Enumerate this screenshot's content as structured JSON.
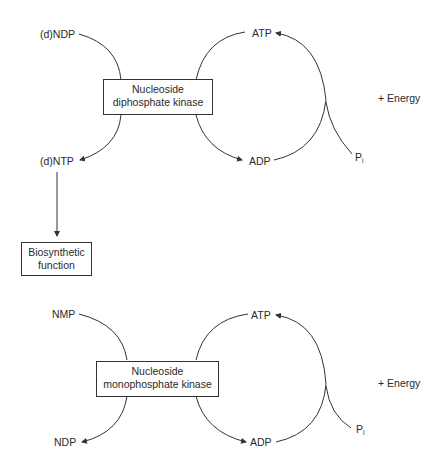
{
  "diagram_top": {
    "substrate": "(d)NDP",
    "product": "(d)NTP",
    "enzyme_line1": "Nucleoside",
    "enzyme_line2": "diphosphate kinase",
    "donor": "ATP",
    "donor_product": "ADP",
    "phosphate": "P",
    "phosphate_sub": "i",
    "energy": "+ Energy",
    "output_line1": "Biosynthetic",
    "output_line2": "function"
  },
  "diagram_bottom": {
    "substrate": "NMP",
    "product": "NDP",
    "enzyme_line1": "Nucleoside",
    "enzyme_line2": "monophosphate kinase",
    "donor": "ATP",
    "donor_product": "ADP",
    "phosphate": "P",
    "phosphate_sub": "i",
    "energy": "+ Energy"
  }
}
